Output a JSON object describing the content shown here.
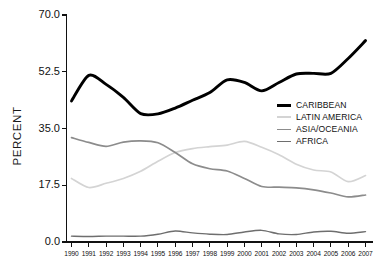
{
  "chart_data": {
    "type": "line",
    "title": "",
    "xlabel": "",
    "ylabel": "PERCENT",
    "grid": false,
    "legend_position": "right-middle",
    "x": [
      1990,
      1991,
      1992,
      1993,
      1994,
      1995,
      1996,
      1997,
      1998,
      1999,
      2000,
      2001,
      2002,
      2003,
      2004,
      2005,
      2006,
      2007
    ],
    "categories": [
      "1990",
      "1991",
      "1992",
      "1993",
      "1994",
      "1995",
      "1996",
      "1997",
      "1998",
      "1999",
      "2000",
      "2001",
      "2002",
      "2003",
      "2004",
      "2005",
      "2006",
      "2007"
    ],
    "ylim": [
      0.0,
      70.0
    ],
    "yticks": [
      0.0,
      17.5,
      35.0,
      52.5,
      70.0
    ],
    "ytick_labels": [
      "0.0",
      "17.5",
      "35.0",
      "52.5",
      "70.0"
    ],
    "series": [
      {
        "name": "CARIBBEAN",
        "color": "#000000",
        "width": 2.9,
        "values": [
          43.5,
          51.4,
          48.6,
          44.6,
          39.6,
          39.5,
          41.3,
          43.7,
          46.1,
          50.0,
          49.2,
          46.6,
          49.2,
          51.8,
          52.0,
          52.0,
          56.6,
          62.1
        ]
      },
      {
        "name": "LATIN AMERICA",
        "color": "#d4d4d4",
        "width": 1.7,
        "values": [
          19.6,
          16.8,
          18.1,
          19.6,
          21.8,
          24.9,
          27.6,
          28.8,
          29.4,
          29.9,
          31.0,
          29.2,
          26.9,
          24.0,
          22.2,
          21.6,
          18.6,
          20.5
        ]
      },
      {
        "name": "ASIA/OCEANIA",
        "color": "#8c8c8c",
        "width": 1.7,
        "values": [
          32.2,
          30.7,
          29.5,
          30.8,
          31.2,
          30.6,
          27.6,
          24.1,
          22.6,
          21.9,
          19.6,
          17.1,
          16.9,
          16.7,
          16.1,
          15.1,
          13.9,
          14.5
        ]
      },
      {
        "name": "AFRICA",
        "color": "#6e6e6e",
        "width": 1.4,
        "values": [
          1.8,
          1.7,
          1.8,
          1.8,
          1.8,
          2.4,
          3.4,
          2.8,
          2.4,
          2.3,
          3.1,
          3.6,
          2.5,
          2.3,
          3.1,
          3.3,
          2.7,
          3.2
        ]
      }
    ]
  },
  "legend": {
    "items": [
      {
        "label": "CARIBBEAN"
      },
      {
        "label": "LATIN AMERICA"
      },
      {
        "label": "ASIA/OCEANIA"
      },
      {
        "label": "AFRICA"
      }
    ]
  }
}
